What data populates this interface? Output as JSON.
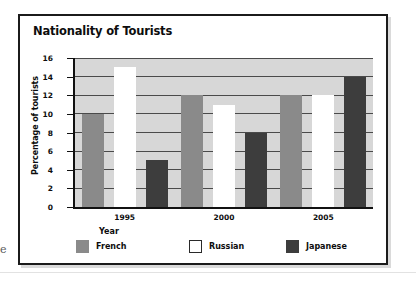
{
  "figure": {
    "edge_glyph": "e"
  },
  "chart_data": {
    "type": "bar",
    "title": "Nationality of Tourists",
    "xlabel": "Year",
    "ylabel": "Percentage of tourists",
    "categories": [
      "1995",
      "2000",
      "2005"
    ],
    "series": [
      {
        "name": "French",
        "color": "#8a8a8a",
        "values": [
          10,
          12,
          12
        ]
      },
      {
        "name": "Russian",
        "color": "#ffffff",
        "values": [
          15,
          11,
          12
        ]
      },
      {
        "name": "Japanese",
        "color": "#3d3d3d",
        "values": [
          5,
          8,
          14
        ]
      }
    ],
    "ylim": [
      0,
      16
    ],
    "y_ticks": [
      0,
      2,
      4,
      6,
      8,
      10,
      12,
      14,
      16
    ],
    "y_tick_labels": [
      "0",
      "2",
      "4",
      "6",
      "8",
      "10",
      "12",
      "14",
      "16"
    ],
    "grid": true,
    "grid_axis": "y",
    "legend_position": "bottom",
    "plot_background": "#d7d7d7",
    "axis_color": "#111111"
  }
}
